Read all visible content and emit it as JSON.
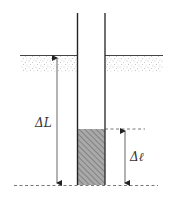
{
  "diagram": {
    "title": "",
    "labels": {
      "delta_L": "ΔL",
      "delta_ell": "Δℓ"
    },
    "colors": {
      "line": "#333333",
      "ground_stipple": "#999999",
      "fill_hatch": "#777777",
      "fill_bg": "#aaaaaa",
      "dashed": "#555555"
    },
    "elements": [
      {
        "name": "tube",
        "description": "vertical open tube inserted into ground"
      },
      {
        "name": "ground-surface",
        "description": "stippled ground layer on both sides of the tube"
      },
      {
        "name": "liquid-column",
        "description": "hatched column at bottom of tube"
      },
      {
        "name": "delta-L-arrow",
        "description": "double arrow from ground surface to bottom"
      },
      {
        "name": "delta-ell-arrow",
        "description": "double arrow spanning the hatched column height"
      }
    ]
  }
}
